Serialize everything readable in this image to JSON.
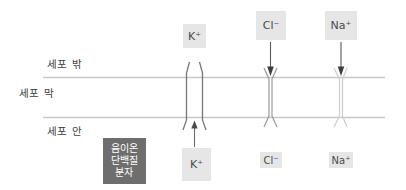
{
  "diagram": {
    "compartments": {
      "outside": "세포 밖",
      "membrane": "세포 막",
      "inside": "세포 안"
    },
    "membrane_line_color": "#c8c8c8",
    "anion_protein": {
      "line1": "음이온",
      "line2": "단백질",
      "line3": "분자",
      "box_color": "#6e6e6e",
      "text_color": "#ffffff"
    },
    "label_box_color": "#e6e6e6",
    "channels": [
      {
        "id": "potassium",
        "ion_base": "K",
        "ion_charge": "+",
        "top_label": "K⁺",
        "bottom_label": "K⁺",
        "state": "open",
        "flow_direction": "inward-to-outward",
        "arrow_direction": "up",
        "color": "#777777"
      },
      {
        "id": "chloride",
        "ion_base": "Cl",
        "ion_charge": "−",
        "top_label": "Cl⁻",
        "bottom_label": "Cl⁻",
        "state": "closed",
        "flow_direction": "outward-to-inward",
        "arrow_direction": "down",
        "color": "#9a9a9a"
      },
      {
        "id": "sodium",
        "ion_base": "Na",
        "ion_charge": "+",
        "top_label": "Na⁺",
        "bottom_label": "Na⁺",
        "state": "closed",
        "flow_direction": "outward-to-inward",
        "arrow_direction": "down",
        "color": "#cdcdcd"
      }
    ]
  }
}
